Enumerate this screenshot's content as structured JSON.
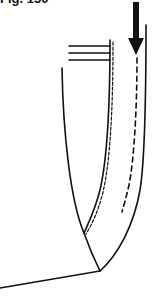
{
  "figure": {
    "title": "Fig. 150",
    "ink_color": "#111111",
    "background": "#ffffff"
  },
  "diagram": {
    "arrow": {
      "direction": "down",
      "x": 136,
      "y_start": 2,
      "y_tip": 55
    },
    "horizontal_lines": [
      {
        "x1": 69,
        "x2": 110,
        "y": 46
      },
      {
        "x1": 69,
        "x2": 110,
        "y": 53
      },
      {
        "x1": 69,
        "x2": 110,
        "y": 60
      }
    ],
    "vertex": {
      "x": 100,
      "y": 271
    },
    "baseline": {
      "x1": 0,
      "y1": 288,
      "x2": 100,
      "y2": 271
    }
  }
}
